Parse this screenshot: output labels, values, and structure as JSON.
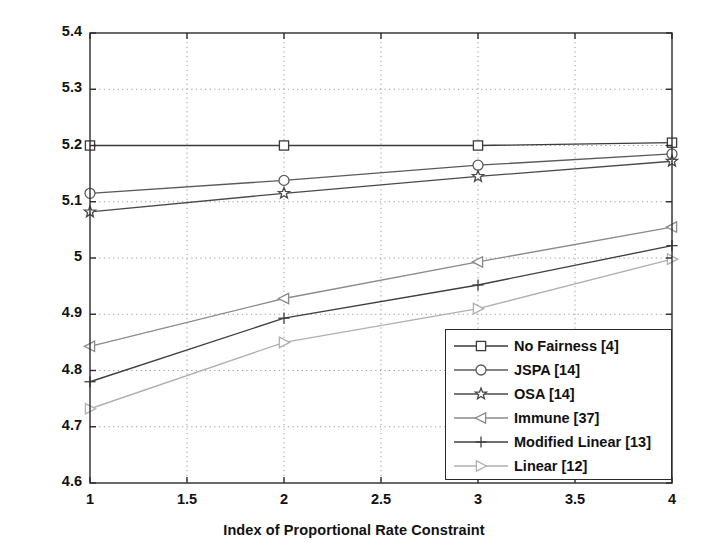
{
  "chart_data": {
    "type": "line",
    "title": "",
    "xlabel": "Index of Proportional Rate Constraint",
    "ylabel": "Sum Capacity (bits/sec/Hz)",
    "xlim": [
      1,
      4
    ],
    "ylim": [
      4.6,
      5.4
    ],
    "xticks": [
      1,
      1.5,
      2,
      2.5,
      3,
      3.5,
      4
    ],
    "xtick_labels": [
      "1",
      "1.5",
      "2",
      "2.5",
      "3",
      "3.5",
      "4"
    ],
    "yticks": [
      4.6,
      4.7,
      4.8,
      4.9,
      5.0,
      5.1,
      5.2,
      5.3,
      5.4
    ],
    "ytick_labels": [
      "4.6",
      "4.7",
      "4.8",
      "4.9",
      "5",
      "5.1",
      "5.2",
      "5.3",
      "5.4"
    ],
    "grid": true,
    "grid_style": "dotted",
    "legend_position": "lower right",
    "x": [
      1,
      2,
      3,
      4
    ],
    "series": [
      {
        "name": "No Fairness [4]",
        "marker": "square",
        "color": "#3b3b3b",
        "values": [
          5.2,
          5.2,
          5.2,
          5.205
        ]
      },
      {
        "name": "JSPA [14]",
        "marker": "circle",
        "color": "#5a5a5a",
        "values": [
          5.115,
          5.138,
          5.165,
          5.185
        ]
      },
      {
        "name": "OSA [14]",
        "marker": "star",
        "color": "#4a4a4a",
        "values": [
          5.082,
          5.115,
          5.145,
          5.172
        ]
      },
      {
        "name": "Immune [37]",
        "marker": "triangle-left",
        "color": "#8a8a8a",
        "values": [
          4.843,
          4.928,
          4.993,
          5.055
        ]
      },
      {
        "name": "Modified Linear [13]",
        "marker": "plus",
        "color": "#3f3f3f",
        "values": [
          4.78,
          4.893,
          4.952,
          5.022
        ]
      },
      {
        "name": "Linear [12]",
        "marker": "triangle-right",
        "color": "#b0b0b0",
        "values": [
          4.732,
          4.85,
          4.91,
          4.998
        ]
      }
    ]
  },
  "axes": {
    "x_title": "Index of Proportional Rate Constraint",
    "y_title": "Sum Capacity (bits/sec/Hz)"
  },
  "legend": {
    "entries": [
      {
        "label": "No Fairness [4]",
        "marker": "square-marker"
      },
      {
        "label": "JSPA [14]",
        "marker": "circle-marker"
      },
      {
        "label": "OSA [14]",
        "marker": "star-marker"
      },
      {
        "label": "Immune [37]",
        "marker": "triangle-left-marker"
      },
      {
        "label": "Modified Linear [13]",
        "marker": "plus-marker"
      },
      {
        "label": "Linear [12]",
        "marker": "triangle-right-marker"
      }
    ]
  },
  "colors": {
    "axis": "#2b2b2b",
    "grid": "#9a9a9a",
    "background": "#ffffff"
  }
}
